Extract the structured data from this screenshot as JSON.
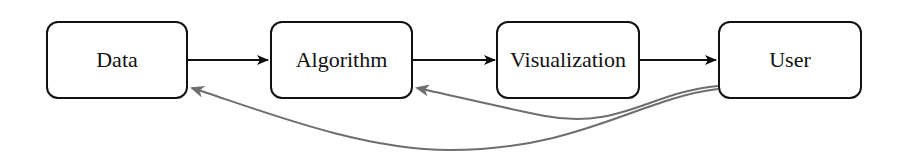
{
  "diagram": {
    "nodes": [
      {
        "id": "data",
        "label": "Data"
      },
      {
        "id": "algorithm",
        "label": "Algorithm"
      },
      {
        "id": "visualization",
        "label": "Visualization"
      },
      {
        "id": "user",
        "label": "User"
      }
    ],
    "edges": [
      {
        "from": "data",
        "to": "algorithm",
        "style": "solid-black"
      },
      {
        "from": "algorithm",
        "to": "visualization",
        "style": "solid-black"
      },
      {
        "from": "visualization",
        "to": "user",
        "style": "solid-black"
      },
      {
        "from": "user",
        "to": "algorithm",
        "style": "gray-curved-feedback"
      },
      {
        "from": "user",
        "to": "data",
        "style": "gray-curved-feedback"
      }
    ],
    "colors": {
      "forward": "#111111",
      "feedback": "#6e6e6e"
    }
  }
}
